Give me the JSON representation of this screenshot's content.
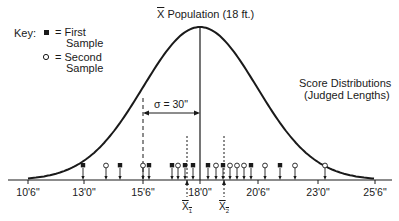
{
  "key": {
    "label": "Key:",
    "first": {
      "symbol": "filled-square",
      "text_line1": "= First",
      "text_line2": "Sample"
    },
    "second": {
      "symbol": "open-circle",
      "text_line1": "= Second",
      "text_line2": "Sample"
    }
  },
  "population_label": "X Population (18 ft.)",
  "population_label_mean": "X",
  "population_label_rest": " Population (18 ft.)",
  "curve_label": {
    "line1": "Score Distributions",
    "line2": "(Judged Lengths)"
  },
  "sigma_label": "σ = 30\"",
  "axis": {
    "ticks": [
      {
        "label": "10'6\"",
        "x": 28
      },
      {
        "label": "13'0\"",
        "x": 84
      },
      {
        "label": "15'6\"",
        "x": 143
      },
      {
        "label": "18'0\"",
        "x": 200
      },
      {
        "label": "20'6\"",
        "x": 258
      },
      {
        "label": "23'0\"",
        "x": 318
      },
      {
        "label": "25'6\"",
        "x": 375
      }
    ]
  },
  "sample_means": [
    {
      "label": "X",
      "sub": "1",
      "x": 187
    },
    {
      "label": "X",
      "sub": "2",
      "x": 224
    }
  ],
  "markers": {
    "first_sample_x": [
      83,
      120,
      149,
      172,
      185,
      193,
      208,
      223,
      251,
      280
    ],
    "second_sample_x": [
      106,
      143,
      178,
      216,
      230,
      237,
      244,
      265,
      295,
      325
    ]
  },
  "colors": {
    "ink": "#1a1a1a",
    "background": "#ffffff"
  }
}
